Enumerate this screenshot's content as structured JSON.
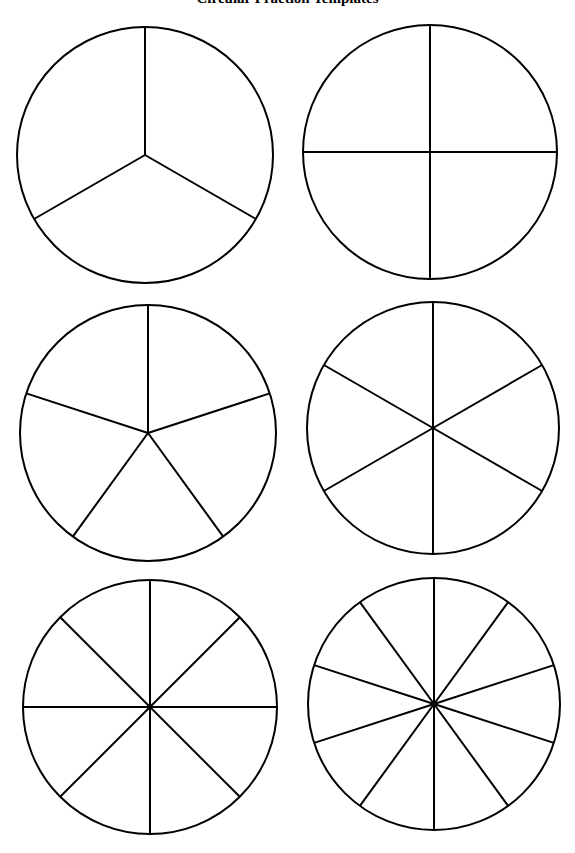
{
  "page": {
    "title": "Circular Fraction Templates"
  },
  "style": {
    "stroke_color": "#000000",
    "fill_color": "#ffffff"
  },
  "circles": [
    {
      "name": "thirds",
      "divisions": 3,
      "cx": 145,
      "cy": 155,
      "r": 128
    },
    {
      "name": "fourths",
      "divisions": 4,
      "cx": 430,
      "cy": 152,
      "r": 127
    },
    {
      "name": "fifths",
      "divisions": 5,
      "cx": 148,
      "cy": 433,
      "r": 128
    },
    {
      "name": "sixths",
      "divisions": 6,
      "cx": 433,
      "cy": 428,
      "r": 126
    },
    {
      "name": "eighths",
      "divisions": 8,
      "cx": 150,
      "cy": 707,
      "r": 127
    },
    {
      "name": "tenths",
      "divisions": 10,
      "cx": 434,
      "cy": 704,
      "r": 126
    }
  ]
}
